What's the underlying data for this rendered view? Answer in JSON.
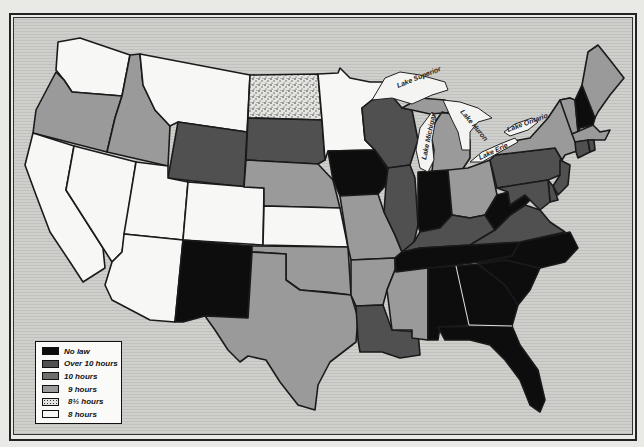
{
  "map": {
    "title": "",
    "subject": "State laws on maximum working hours",
    "categories": {
      "no_law": {
        "label": "No law",
        "color": "#0d0d0d"
      },
      "over_10": {
        "label": "Over 10 hours",
        "color": "#505050"
      },
      "ten": {
        "label": "10 hours",
        "color": "#6e6e6e"
      },
      "nine": {
        "label": "9 hours",
        "color": "#9a9a9a"
      },
      "eight_half": {
        "label": "8½ hours",
        "color": "#d8d8d4",
        "pattern": "speckled"
      },
      "eight": {
        "label": "8 hours",
        "color": "#f7f7f5"
      }
    },
    "legend": [
      {
        "key": "no_law",
        "label": "No law",
        "color": "#0d0d0d"
      },
      {
        "key": "over_10",
        "label": "Over 10 hours",
        "color": "#505050"
      },
      {
        "key": "ten",
        "label": "10 hours",
        "color": "#6e6e6e"
      },
      {
        "key": "nine",
        "label": "9 hours",
        "color": "#9a9a9a"
      },
      {
        "key": "eight_half",
        "label": "8½ hours",
        "color": "#d8d8d4"
      },
      {
        "key": "eight",
        "label": "8 hours",
        "color": "#f7f7f5"
      }
    ],
    "lakes": [
      {
        "name": "Lake Superior",
        "label": "Lake Superior"
      },
      {
        "name": "Lake Michigan",
        "label": "Lake Michigan"
      },
      {
        "name": "Lake Huron",
        "label": "Lake Huron"
      },
      {
        "name": "Lake Erie",
        "label": "Lake Erie"
      },
      {
        "name": "Lake Ontario",
        "label": "Lake Ontario"
      }
    ],
    "states": {
      "WA": "eight",
      "OR": "nine",
      "CA": "eight",
      "NV": "eight",
      "ID": "nine",
      "MT": "eight",
      "WY": "over_10",
      "UT": "eight",
      "AZ": "eight",
      "CO": "eight",
      "NM": "no_law",
      "ND": "eight_half",
      "SD": "over_10",
      "NE": "nine",
      "KS": "eight",
      "OK": "nine",
      "TX": "nine",
      "MN": "eight",
      "IA": "no_law",
      "MO": "nine",
      "AR": "nine",
      "LA": "over_10",
      "WI": "over_10",
      "IL": "over_10",
      "MI": "nine",
      "IN": "no_law",
      "OH": "nine",
      "KY": "over_10",
      "TN": "no_law",
      "MS": "nine",
      "AL": "no_law",
      "GA": "no_law",
      "FL": "no_law",
      "SC": "no_law",
      "NC": "no_law",
      "WV": "no_law",
      "VA": "over_10",
      "PA": "over_10",
      "NY": "nine",
      "VT": "nine",
      "NH": "no_law",
      "ME": "nine",
      "MA": "nine",
      "CT": "over_10",
      "RI": "over_10",
      "NJ": "over_10",
      "DE": "over_10",
      "MD": "over_10"
    }
  }
}
